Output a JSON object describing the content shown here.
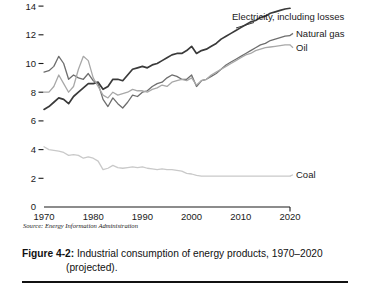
{
  "figure": {
    "caption_label": "Figure 4-2:",
    "caption_text": " Industrial consumption of energy products, 1970–2020",
    "caption_text_line2": "(projected).",
    "source_note": "Source: Energy Information Administration"
  },
  "chart_data": {
    "type": "line",
    "title": "Industrial consumption of energy products, 1970–2020 (projected)",
    "xlabel": "",
    "ylabel": "",
    "xlim": [
      1970,
      2020
    ],
    "ylim": [
      0,
      15
    ],
    "grid": false,
    "legend_position": "right-inline",
    "x_ticks": [
      "1970",
      "1980",
      "1990",
      "2000",
      "2010",
      "2020"
    ],
    "x_tick_values": [
      1970,
      1980,
      1990,
      2000,
      2010,
      2020
    ],
    "y_ticks": [
      "0",
      "2",
      "4",
      "6",
      "8",
      "10",
      "12",
      "14"
    ],
    "y_tick_values": [
      0,
      2,
      4,
      6,
      8,
      10,
      12,
      14
    ],
    "x": [
      1970,
      1971,
      1972,
      1973,
      1974,
      1975,
      1976,
      1977,
      1978,
      1979,
      1980,
      1981,
      1982,
      1983,
      1984,
      1985,
      1986,
      1987,
      1988,
      1989,
      1990,
      1991,
      1992,
      1993,
      1994,
      1995,
      1996,
      1997,
      1998,
      1999,
      2000,
      2001,
      2002,
      2003,
      2004,
      2005,
      2006,
      2007,
      2008,
      2009,
      2010,
      2011,
      2012,
      2013,
      2014,
      2015,
      2016,
      2017,
      2018,
      2019,
      2020
    ],
    "series": [
      {
        "name": "Electricity, including losses",
        "color": "#3a3a3a",
        "width": 1.7,
        "label_x": 2002,
        "label_y": 14.6,
        "values": [
          6.8,
          7.0,
          7.3,
          7.6,
          7.5,
          7.2,
          7.7,
          8.0,
          8.3,
          8.6,
          8.6,
          8.7,
          8.2,
          8.4,
          8.9,
          8.9,
          8.8,
          9.2,
          9.6,
          9.7,
          9.8,
          9.7,
          9.9,
          10.0,
          10.2,
          10.4,
          10.6,
          10.7,
          10.7,
          10.9,
          11.2,
          10.7,
          10.9,
          11.0,
          11.2,
          11.4,
          11.7,
          11.9,
          12.1,
          12.3,
          12.5,
          12.7,
          12.9,
          13.0,
          13.2,
          13.3,
          13.5,
          13.6,
          13.7,
          13.8,
          13.85
        ]
      },
      {
        "name": "Natural gas",
        "color": "#6e6e6e",
        "width": 1.3,
        "label_x": 2021,
        "label_y": 12.1,
        "values": [
          9.4,
          9.5,
          9.8,
          10.5,
          10.0,
          8.9,
          9.2,
          9.0,
          8.9,
          9.3,
          8.8,
          8.6,
          7.5,
          7.0,
          7.6,
          7.2,
          6.9,
          7.3,
          7.8,
          7.7,
          8.0,
          8.1,
          8.4,
          8.6,
          8.7,
          9.0,
          9.2,
          9.1,
          8.9,
          8.9,
          9.2,
          8.4,
          8.8,
          8.9,
          9.1,
          9.3,
          9.6,
          9.9,
          10.1,
          10.3,
          10.5,
          10.7,
          10.9,
          11.1,
          11.3,
          11.4,
          11.6,
          11.7,
          11.8,
          11.9,
          11.95
        ]
      },
      {
        "name": "Oil",
        "color": "#a8a8a8",
        "width": 1.3,
        "label_x": 2021,
        "label_y": 11.1,
        "values": [
          8.0,
          8.0,
          8.4,
          9.2,
          8.6,
          8.0,
          8.4,
          9.6,
          10.5,
          10.2,
          9.0,
          8.4,
          7.8,
          7.6,
          8.0,
          7.8,
          7.9,
          8.0,
          8.2,
          8.1,
          8.1,
          8.0,
          8.2,
          8.3,
          8.5,
          8.4,
          8.7,
          8.8,
          8.9,
          8.8,
          9.0,
          8.5,
          8.8,
          8.9,
          9.2,
          9.4,
          9.6,
          9.8,
          10.0,
          10.2,
          10.4,
          10.6,
          10.7,
          10.9,
          11.0,
          11.1,
          11.15,
          11.2,
          11.25,
          11.3,
          11.3
        ]
      },
      {
        "name": "Coal",
        "color": "#c9c9c9",
        "width": 1.3,
        "label_x": 2021,
        "label_y": 2.25,
        "values": [
          4.2,
          4.0,
          3.95,
          3.9,
          3.8,
          3.6,
          3.65,
          3.6,
          3.4,
          3.5,
          3.4,
          3.2,
          2.6,
          2.7,
          2.9,
          2.75,
          2.7,
          2.75,
          2.8,
          2.75,
          2.8,
          2.7,
          2.65,
          2.6,
          2.65,
          2.6,
          2.6,
          2.55,
          2.5,
          2.35,
          2.3,
          2.2,
          2.15,
          2.15,
          2.15,
          2.15,
          2.15,
          2.15,
          2.15,
          2.15,
          2.15,
          2.15,
          2.15,
          2.15,
          2.15,
          2.15,
          2.15,
          2.15,
          2.15,
          2.15,
          2.15
        ]
      }
    ]
  }
}
